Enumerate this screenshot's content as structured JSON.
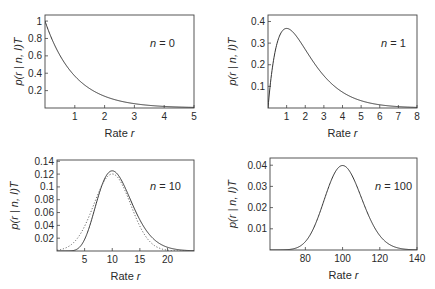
{
  "chart_data": [
    {
      "type": "line",
      "panel": "top-left",
      "annotation": "n=0",
      "n": 0,
      "xlabel": "Rate r",
      "ylabel": "p(r | n, I)T",
      "xlim": [
        0,
        5
      ],
      "ylim": [
        0,
        1.07
      ],
      "xticks": [
        1,
        2,
        3,
        4,
        5
      ],
      "yticks": [
        0.2,
        0.4,
        0.6,
        0.8,
        1
      ],
      "ytick_labels": [
        "0.2",
        "0.4",
        "0.6",
        "0.8",
        "1"
      ],
      "series": [
        {
          "name": "gamma",
          "style": "solid",
          "formula": "r^n e^-r / n!",
          "x": [
            0,
            0.5,
            1,
            1.5,
            2,
            2.5,
            3,
            3.5,
            4,
            4.5,
            5
          ],
          "y": [
            1.0,
            0.607,
            0.368,
            0.223,
            0.135,
            0.082,
            0.05,
            0.03,
            0.018,
            0.011,
            0.007
          ]
        }
      ]
    },
    {
      "type": "line",
      "panel": "top-right",
      "annotation": "n=1",
      "n": 1,
      "xlabel": "Rate r",
      "ylabel": "p(r | n, I)T",
      "xlim": [
        0,
        8
      ],
      "ylim": [
        0,
        0.43
      ],
      "xticks": [
        1,
        2,
        3,
        4,
        5,
        6,
        7,
        8
      ],
      "yticks": [
        0.1,
        0.2,
        0.3,
        0.4
      ],
      "ytick_labels": [
        "0.1",
        "0.2",
        "0.3",
        "0.4"
      ],
      "series": [
        {
          "name": "gamma",
          "style": "solid",
          "formula": "r^n e^-r / n!",
          "x": [
            0,
            0.5,
            1,
            1.5,
            2,
            3,
            4,
            5,
            6,
            7,
            8
          ],
          "y": [
            0,
            0.303,
            0.368,
            0.335,
            0.271,
            0.149,
            0.073,
            0.034,
            0.015,
            0.006,
            0.003
          ]
        }
      ]
    },
    {
      "type": "line",
      "panel": "bottom-left",
      "annotation": "n=10",
      "n": 10,
      "xlabel": "Rate r",
      "ylabel": "p(r | n, I)T",
      "xlim": [
        0,
        24.8
      ],
      "ylim": [
        0,
        0.142
      ],
      "xticks": [
        5,
        10,
        15,
        20
      ],
      "yticks": [
        0.02,
        0.04,
        0.06,
        0.08,
        0.1,
        0.12,
        0.14
      ],
      "ytick_labels": [
        "0.02",
        "0.04",
        "0.06",
        "0.08",
        "0.1",
        "0.12",
        "0.14"
      ],
      "series": [
        {
          "name": "gamma",
          "style": "solid",
          "formula": "r^n e^-r / n!",
          "x": [
            2,
            4,
            6,
            8,
            10,
            12,
            14,
            16,
            18,
            20,
            22,
            24
          ],
          "y": [
            0.0004,
            0.0053,
            0.0413,
            0.0993,
            0.1251,
            0.1048,
            0.0661,
            0.034,
            0.015,
            0.0058,
            0.002,
            0.0006
          ]
        },
        {
          "name": "gaussian approximation",
          "style": "dotted",
          "mean": 10,
          "sd": 3.32,
          "x": [
            0,
            2,
            4,
            6,
            8,
            10,
            12,
            14,
            16,
            18,
            20,
            22,
            24
          ],
          "y": [
            0.0016,
            0.0066,
            0.0234,
            0.058,
            0.0997,
            0.1201,
            0.0997,
            0.058,
            0.0234,
            0.0066,
            0.0013,
            0.0002,
            2e-05
          ]
        }
      ]
    },
    {
      "type": "line",
      "panel": "bottom-right",
      "annotation": "n=100",
      "n": 100,
      "xlabel": "Rate r",
      "ylabel": "p(r | n, I)T",
      "xlim": [
        61,
        140
      ],
      "ylim": [
        0,
        0.0434
      ],
      "xticks": [
        80,
        100,
        120,
        140
      ],
      "yticks": [
        0.01,
        0.02,
        0.03,
        0.04
      ],
      "ytick_labels": [
        "0.01",
        "0.02",
        "0.03",
        "0.04"
      ],
      "series": [
        {
          "name": "gamma",
          "style": "solid",
          "formula": "r^n e^-r / n!",
          "x": [
            70,
            80,
            90,
            100,
            110,
            120,
            130,
            140
          ],
          "y": [
            0.0004,
            0.0052,
            0.0242,
            0.0398,
            0.0245,
            0.0059,
            0.0006,
            3e-05
          ]
        }
      ]
    }
  ],
  "panels": [
    {
      "n_label_prefix": "n",
      "n_label_eq": " = ",
      "n_value": "0"
    },
    {
      "n_label_prefix": "n",
      "n_label_eq": " = ",
      "n_value": "1"
    },
    {
      "n_label_prefix": "n",
      "n_label_eq": " = ",
      "n_value": "10"
    },
    {
      "n_label_prefix": "n",
      "n_label_eq": " = ",
      "n_value": "100"
    }
  ],
  "axis_text": {
    "xlabel_word": "Rate ",
    "xlabel_var": "r",
    "ylabel_p": "p(r",
    "ylabel_bar": " | ",
    "ylabel_rest": "n, I)T"
  }
}
